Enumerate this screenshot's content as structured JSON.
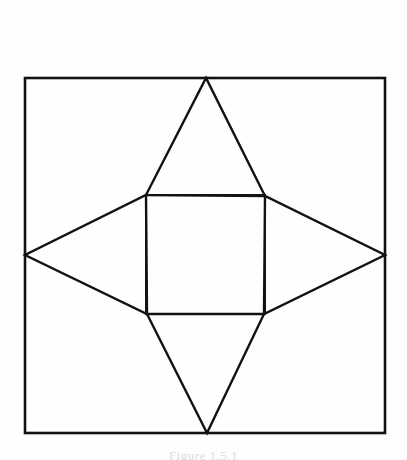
{
  "figure": {
    "caption": "Figure 1.5.1",
    "background_color": "#fefefe",
    "stroke_color": "#121212",
    "stroke_width": 2.2,
    "outer_square": {
      "name": "outer-square",
      "left": 25,
      "top": 78,
      "right": 385,
      "bottom": 433,
      "width": 360,
      "height": 355
    },
    "inner_square": {
      "name": "inner-square",
      "left": 146,
      "top": 195,
      "right": 265,
      "bottom": 314,
      "width": 119,
      "height": 119
    },
    "star_points": {
      "top": {
        "x": 206,
        "y": 78
      },
      "right": {
        "x": 385,
        "y": 255
      },
      "bottom": {
        "x": 207,
        "y": 433
      },
      "left": {
        "x": 25,
        "y": 255
      }
    },
    "triangles": [
      {
        "name": "triangle-top",
        "points": "146,195 265,196 206,78"
      },
      {
        "name": "triangle-right",
        "points": "265,196 264,314 385,255"
      },
      {
        "name": "triangle-bottom",
        "points": "264,314 147,314 207,433"
      },
      {
        "name": "triangle-left",
        "points": "147,314 146,195 25,255"
      }
    ]
  }
}
